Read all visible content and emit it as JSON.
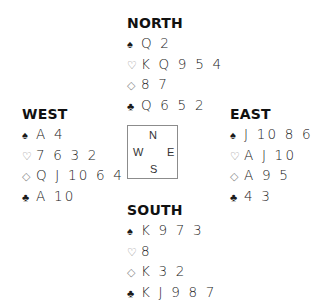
{
  "suit_symbols": {
    "spades": "♠",
    "hearts": "♡",
    "diamonds": "◇",
    "clubs": "♣"
  },
  "hands": {
    "north": {
      "title": "NORTH",
      "spades": "Q 2",
      "hearts": "K Q 9 5 4",
      "diamonds": "8 7",
      "clubs": "Q 6 5 2"
    },
    "west": {
      "title": "WEST",
      "spades": "A 4",
      "hearts": "7 6 3 2",
      "diamonds": "Q J 10 6 4",
      "clubs": "A 10"
    },
    "east": {
      "title": "EAST",
      "spades": "J 10 8 6 5",
      "hearts": "A J 10",
      "diamonds": "A 9 5",
      "clubs": "4 3"
    },
    "south": {
      "title": "SOUTH",
      "spades": "K 9 7 3",
      "hearts": "8",
      "diamonds": "K 3 2",
      "clubs": "K J 9 8 7"
    }
  },
  "compass": {
    "n": "N",
    "w": "W",
    "e": "E",
    "s": "S"
  },
  "colors": {
    "text": "#1a1a1a",
    "outline_suit": "#8a8a8a",
    "compass_border": "#8c8c8c",
    "background": "#ffffff"
  }
}
